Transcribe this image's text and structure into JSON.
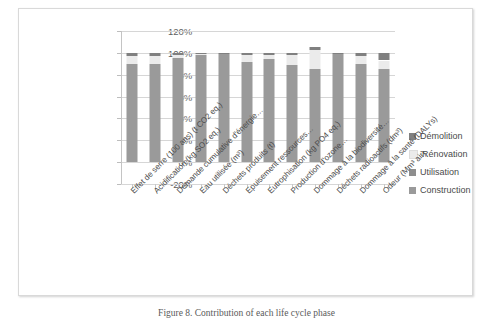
{
  "caption": "Figure 8.  Contribution of each life cycle phase",
  "legend": {
    "position": "right",
    "items": [
      {
        "label": "Démolition",
        "color": "#808080"
      },
      {
        "label": "Rénovation",
        "color": "#ebebeb"
      },
      {
        "label": "Utilisation",
        "color": "#8e8e8e"
      },
      {
        "label": "Construction",
        "color": "#9a9a9a"
      }
    ]
  },
  "axis": {
    "y_ticks": [
      "120%",
      "100%",
      "80%",
      "60%",
      "40%",
      "20%",
      "0%",
      "-20%"
    ],
    "y_tick_values": [
      120,
      100,
      80,
      60,
      40,
      20,
      0,
      -20
    ],
    "ylabel": "",
    "xlabel": ""
  },
  "chart_data": {
    "type": "bar",
    "subtype": "stacked-column",
    "title": "",
    "xlabel": "",
    "ylabel": "",
    "ylim": [
      -20,
      120
    ],
    "grid": true,
    "legend_position": "right",
    "categories": [
      "Effet de serre (100 ans) (t CO2 eq.)",
      "Acidification (kg SO2 eq.)",
      "Demande cumulative d'énergie…",
      "Eau utilisée (m³)",
      "Déchets produits (t)",
      "Epuisement ressources…",
      "Eutrophisation (kg PO4 eq.)",
      "Production d'ozone…",
      "Dommage à la biodiversité…",
      "Déchets radioactifs (dm³)",
      "Dommage à la santé (DALYs)",
      "Odeur (Mm³ air)"
    ],
    "series": [
      {
        "name": "Construction",
        "color": "#9a9a9a",
        "values": [
          90,
          90,
          95,
          98,
          99,
          92,
          94,
          89,
          85,
          99,
          90,
          85
        ]
      },
      {
        "name": "Utilisation",
        "color": "#8e8e8e",
        "values": [
          0,
          0,
          0,
          0,
          0,
          0,
          0,
          0,
          0,
          0,
          0,
          0
        ]
      },
      {
        "name": "Rénovation",
        "color": "#ebebeb",
        "values": [
          7,
          7,
          3,
          1,
          0,
          6,
          4,
          9,
          18,
          0,
          7,
          8
        ]
      },
      {
        "name": "Démolition",
        "color": "#808080",
        "values": [
          3,
          3,
          2,
          1,
          1,
          2,
          2,
          2,
          2,
          1,
          3,
          7
        ]
      }
    ]
  }
}
